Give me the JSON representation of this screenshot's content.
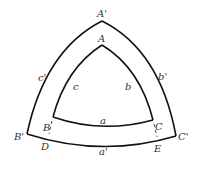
{
  "diagram": {
    "type": "nested spherical triangles",
    "outer_triangle": {
      "vertices": {
        "top": "A'",
        "left": "B'",
        "right": "C'"
      },
      "sides": {
        "left": "c'",
        "right": "b'",
        "bottom": "a'"
      }
    },
    "inner_triangle": {
      "vertices": {
        "top": "A",
        "left": "B",
        "right": "C"
      },
      "sides": {
        "left": "c",
        "right": "b",
        "bottom": "a"
      }
    },
    "extra_points": {
      "left": "D",
      "right": "E"
    }
  }
}
